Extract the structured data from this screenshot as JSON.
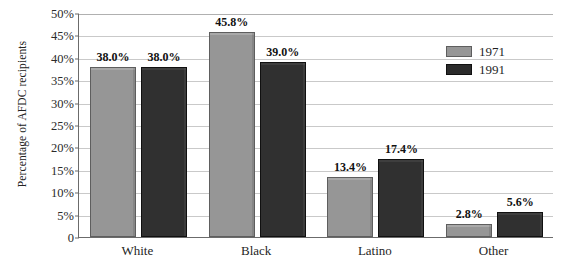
{
  "chart_data": {
    "type": "bar",
    "title": "",
    "xlabel": "",
    "ylabel": "Percentage of AFDC recipients",
    "categories": [
      "White",
      "Black",
      "Latino",
      "Other"
    ],
    "series": [
      {
        "name": "1971",
        "color": "#969696",
        "values": [
          38.0,
          45.8,
          13.4,
          2.8
        ],
        "labels": [
          "38.0%",
          "45.8%",
          "13.4%",
          "2.8%"
        ]
      },
      {
        "name": "1991",
        "color": "#303030",
        "values": [
          38.0,
          39.0,
          17.4,
          5.6
        ],
        "labels": [
          "38.0%",
          "39.0%",
          "17.4%",
          "5.6%"
        ]
      }
    ],
    "ylim": [
      0,
      50
    ],
    "ytick_values": [
      0,
      5,
      10,
      15,
      20,
      25,
      30,
      35,
      40,
      45,
      50
    ],
    "ytick_labels": [
      "0",
      "5%",
      "10%",
      "15%",
      "20%",
      "25%",
      "30%",
      "35%",
      "40%",
      "45%",
      "50%"
    ],
    "grid": true,
    "legend_position": "top-right",
    "legend_entries": [
      "1971",
      "1991"
    ]
  },
  "axis": {
    "y_title": "Percentage of AFDC recipients"
  },
  "legend": {
    "items": [
      {
        "label": "1971"
      },
      {
        "label": "1991"
      }
    ]
  }
}
